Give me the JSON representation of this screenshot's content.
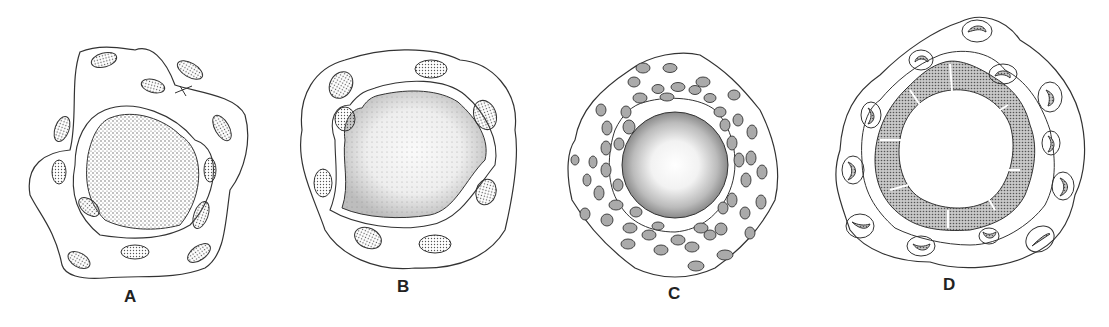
{
  "figure": {
    "panels": [
      {
        "id": "A",
        "label": "A",
        "description": "Cross-section with dense dotted core surrounded by a ring of oval cells and outer wavy membrane"
      },
      {
        "id": "B",
        "label": "B",
        "description": "Cross-section with stippled core, lighter center, ring of oval cells"
      },
      {
        "id": "C",
        "label": "C",
        "description": "Cross-section with clear center, stippled ring and many small oval cells in several layers"
      },
      {
        "id": "D",
        "label": "D",
        "description": "Cross-section with empty lumen, folded stippled wall and crescent-shaped cells"
      }
    ],
    "colors": {
      "ink": "#333333",
      "stipple": "#555555",
      "background": "#ffffff"
    }
  }
}
